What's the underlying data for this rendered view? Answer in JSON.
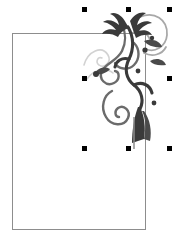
{
  "app": {
    "view_name": "canvas",
    "background_color": "#ffffff"
  },
  "canvas": {
    "width": 182,
    "height": 249,
    "label": "document-canvas"
  },
  "page_frame": {
    "name": "page-rectangle",
    "x": 12,
    "y": 33,
    "width": 134,
    "height": 197,
    "stroke_color": "#8d8d8d",
    "stroke_width": 1,
    "fill_color": "#ffffff"
  },
  "ornament": {
    "name": "floral-flourish-clipart",
    "description": "Decorative floral swirl with leaves, curls and a solid dark stem",
    "x": 82,
    "y": 7,
    "width": 90,
    "height": 142,
    "colors": {
      "dark": "#3a3a3a",
      "mid": "#6b6b6b",
      "light": "#a8a8a8",
      "faint": "#d2d2d2"
    }
  },
  "selection": {
    "name": "selection-handles",
    "handle_color": "#000000",
    "handle_size": 5,
    "bounds": {
      "x": 82,
      "y": 7,
      "width": 90,
      "height": 144
    },
    "handles": [
      {
        "name": "handle-top-left",
        "x": 82,
        "y": 7,
        "cursor": "nwse-resize"
      },
      {
        "name": "handle-top-center",
        "x": 126,
        "y": 7,
        "cursor": "ns-resize"
      },
      {
        "name": "handle-top-right",
        "x": 167,
        "y": 7,
        "cursor": "nesw-resize"
      },
      {
        "name": "handle-middle-left",
        "x": 82,
        "y": 76,
        "cursor": "ew-resize"
      },
      {
        "name": "handle-middle-right",
        "x": 167,
        "y": 76,
        "cursor": "ew-resize"
      },
      {
        "name": "handle-bottom-left",
        "x": 82,
        "y": 146,
        "cursor": "nwse-resize"
      },
      {
        "name": "handle-bottom-center",
        "x": 126,
        "y": 146,
        "cursor": "ns-resize"
      },
      {
        "name": "handle-bottom-right",
        "x": 167,
        "y": 146,
        "cursor": "nesw-resize"
      }
    ]
  }
}
